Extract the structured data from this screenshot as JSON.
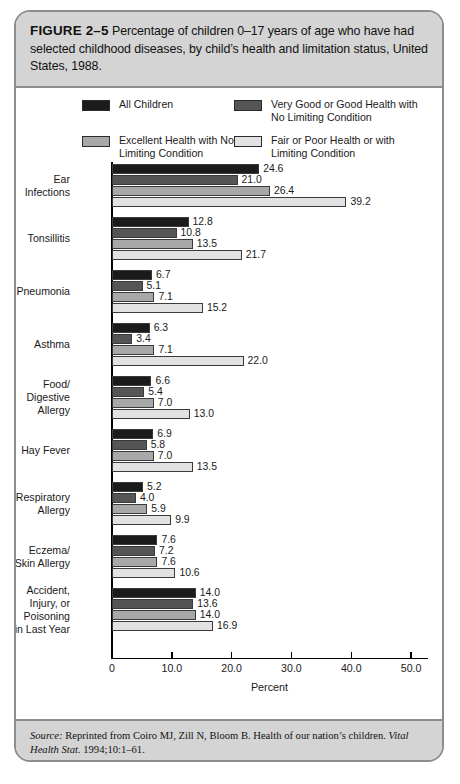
{
  "figure": {
    "number_label": "FIGURE 2–5",
    "caption": "Percentage of children 0–17 years of age who have had selected childhood diseases, by child’s health and limitation status, United States, 1988."
  },
  "legend": {
    "items": [
      {
        "label": "All Children",
        "color": "#1b1b1b",
        "swatch": "legend-swatch-all-children"
      },
      {
        "label": "Very Good or Good Health with No Limiting Condition",
        "color": "#555555",
        "swatch": "legend-swatch-very-good-good"
      },
      {
        "label": "Excellent Health with No Limiting Condition",
        "color": "#a8a8a8",
        "swatch": "legend-swatch-excellent"
      },
      {
        "label": "Fair or Poor Health or with Limiting Condition",
        "color": "#e2e2e2",
        "swatch": "legend-swatch-fair-poor"
      }
    ]
  },
  "source": {
    "lead": "Source:",
    "body_1": " Reprinted from Coiro MJ, Zill N, Bloom B. Health of our nation’s children. ",
    "journal": "Vital Health Stat.",
    "body_2": " 1994;10:1–61."
  },
  "chart_data": {
    "type": "bar",
    "orientation": "horizontal",
    "title": "Percentage of children 0–17 years of age who have had selected childhood diseases, by child’s health and limitation status, United States, 1988.",
    "xlabel": "Percent",
    "ylabel": "",
    "xlim": [
      0,
      53
    ],
    "xticks": [
      0,
      10,
      20,
      30,
      40,
      50
    ],
    "xtick_labels": [
      "0",
      "10.0",
      "20.0",
      "30.0",
      "40.0",
      "50.0"
    ],
    "grid": false,
    "legend_position": "top",
    "categories": [
      "Ear Infections",
      "Tonsillitis",
      "Pneumonia",
      "Asthma",
      "Food/ Digestive Allergy",
      "Hay Fever",
      "Respiratory Allergy",
      "Eczema/ Skin Allergy",
      "Accident, Injury, or Poisoning in Last Year"
    ],
    "category_lines": [
      [
        "Ear",
        "Infections"
      ],
      [
        "Tonsillitis"
      ],
      [
        "Pneumonia"
      ],
      [
        "Asthma"
      ],
      [
        "Food/",
        "Digestive",
        "Allergy"
      ],
      [
        "Hay Fever"
      ],
      [
        "Respiratory",
        "Allergy"
      ],
      [
        "Eczema/",
        "Skin Allergy"
      ],
      [
        "Accident,",
        "Injury, or",
        "Poisoning",
        "in Last Year"
      ]
    ],
    "series": [
      {
        "name": "All Children",
        "color": "#1b1b1b",
        "values": [
          24.6,
          12.8,
          6.7,
          6.3,
          6.6,
          6.9,
          5.2,
          7.6,
          14.0
        ],
        "labels": [
          "24.6",
          "12.8",
          "6.7",
          "6.3",
          "6.6",
          "6.9",
          "5.2",
          "7.6",
          "14.0"
        ]
      },
      {
        "name": "Very Good or Good Health with No Limiting Condition",
        "color": "#555555",
        "values": [
          21.0,
          10.8,
          5.1,
          3.4,
          5.4,
          5.8,
          4.0,
          7.2,
          13.6
        ],
        "labels": [
          "21.0",
          "10.8",
          "5.1",
          "3.4",
          "5.4",
          "5.8",
          "4.0",
          "7.2",
          "13.6"
        ]
      },
      {
        "name": "Excellent Health with No Limiting Condition",
        "color": "#a8a8a8",
        "values": [
          26.4,
          13.5,
          7.1,
          7.1,
          7.0,
          7.0,
          5.9,
          7.6,
          14.0
        ],
        "labels": [
          "26.4",
          "13.5",
          "7.1",
          "7.1",
          "7.0",
          "7.0",
          "5.9",
          "7.6",
          "14.0"
        ]
      },
      {
        "name": "Fair or Poor Health or with Limiting Condition",
        "color": "#e2e2e2",
        "values": [
          39.2,
          21.7,
          15.2,
          22.0,
          13.0,
          13.5,
          9.9,
          10.6,
          16.9
        ],
        "labels": [
          "39.2",
          "21.7",
          "15.2",
          "22.0",
          "13.0",
          "13.5",
          "9.9",
          "10.6",
          "16.9"
        ]
      }
    ]
  }
}
